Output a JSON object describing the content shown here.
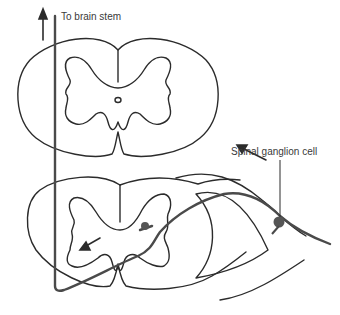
{
  "labels": {
    "to_brain_stem": "To brain stem",
    "spinal_ganglion_cell": "Spinal ganglion cell"
  },
  "colors": {
    "stroke": "#2b2b2b",
    "neuron_path": "#4a4a4a",
    "cell_body": "#555555",
    "background": "#ffffff"
  },
  "figure": {
    "arrows": [
      "upward arrow toward brain stem",
      "arrow along dorsal root toward cord",
      "arrow inside gray matter pointing left"
    ]
  }
}
